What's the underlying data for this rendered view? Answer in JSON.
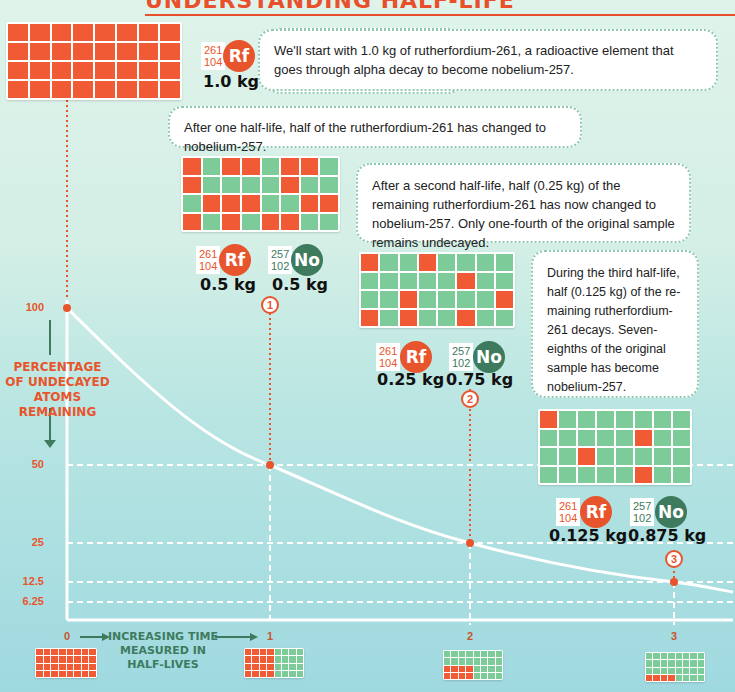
{
  "title": "UNDERSTANDING HALF-LIFE",
  "colors": {
    "rf": "#e8552c",
    "no": "#3d7a5e",
    "undecayed": "#f05a35",
    "decayed": "#7ecb9a"
  },
  "stages": [
    {
      "text": "We'll start with 1.0 kg of rutherfordium-261, a radioactive element that goes through alpha decay to become nobelium-257.",
      "rf": {
        "symbol": "Rf",
        "mass_number": "261",
        "atomic_number": "104",
        "mass": "1.0 kg"
      }
    },
    {
      "text": "After one half-life, half of the rutherfordium-261 has changed to nobelium-257.",
      "marker": "1",
      "rf": {
        "symbol": "Rf",
        "mass_number": "261",
        "atomic_number": "104",
        "mass": "0.5 kg"
      },
      "no": {
        "symbol": "No",
        "mass_number": "257",
        "atomic_number": "102",
        "mass": "0.5 kg"
      }
    },
    {
      "text": "After a second half-life, half (0.25 kg) of the remaining rutherfordium-261 has now changed to nobelium-257. Only one-fourth of the original sample remains undecayed.",
      "marker": "2",
      "rf": {
        "symbol": "Rf",
        "mass_number": "261",
        "atomic_number": "104",
        "mass": "0.25 kg"
      },
      "no": {
        "symbol": "No",
        "mass_number": "257",
        "atomic_number": "102",
        "mass": "0.75 kg"
      }
    },
    {
      "text": "During the third half-life, half (0.125 kg) of the re-maining rutherfordium-261 decays. Seven-eighths of the original sample has become nobelium-257.",
      "marker": "3",
      "rf": {
        "symbol": "Rf",
        "mass_number": "261",
        "atomic_number": "104",
        "mass": "0.125 kg"
      },
      "no": {
        "symbol": "No",
        "mass_number": "257",
        "atomic_number": "102",
        "mass": "0.875 kg"
      }
    }
  ],
  "grids": [
    [
      "RRRRRRRR",
      "RRRRRRRR",
      "RRRRRRRR",
      "RRRRRRRR"
    ],
    [
      "RGRRGRRG",
      "RGGGGRGG",
      "GRRRGGRR",
      "RGRGRRGG"
    ],
    [
      "RGGRGGGG",
      "GGGGGRGG",
      "GGRGGGGR",
      "RGRGGRGG"
    ],
    [
      "RGGGGGGG",
      "GGGGGRGG",
      "GGRGGGGG",
      "GGGGGRGG"
    ]
  ],
  "small_grids": [
    [
      "RRRRRRRR",
      "RRRRRRRR",
      "RRRRRRRR",
      "RRRRRRRR"
    ],
    [
      "RRRRGGGG",
      "RRRRGGGG",
      "RRRRGGGG",
      "RRRRGGGG"
    ],
    [
      "GGGGGGGG",
      "GGGGGGGG",
      "RRRRGGGG",
      "RRRRGGGG"
    ],
    [
      "GGGGGGGG",
      "GGGGGGGG",
      "GGGGGGGG",
      "RRRRGGGG"
    ]
  ],
  "axes": {
    "y_title": "PERCENTAGE OF UNDECAYED ATOMS REMAINING",
    "y_title_lines": [
      "PERCENTAGE",
      "OF UNDECAYED",
      "ATOMS REMAINING"
    ],
    "y_ticks": [
      "100",
      "50",
      "25",
      "12.5",
      "6.25"
    ],
    "x_title_lines": [
      "INCREASING TIME",
      "MEASURED IN",
      "HALF-LIVES"
    ],
    "x_ticks": [
      "0",
      "1",
      "2",
      "3"
    ]
  },
  "chart_data": {
    "type": "line",
    "title": "Understanding Half-Life",
    "xlabel": "Increasing time measured in half-lives",
    "ylabel": "Percentage of undecayed atoms remaining",
    "x": [
      0,
      1,
      2,
      3
    ],
    "series": [
      {
        "name": "Undecayed Rf-261 (%)",
        "values": [
          100,
          50,
          25,
          12.5
        ]
      }
    ],
    "y_ticks": [
      100,
      50,
      25,
      12.5,
      6.25
    ],
    "grid": "dashed reference lines at tick values"
  }
}
